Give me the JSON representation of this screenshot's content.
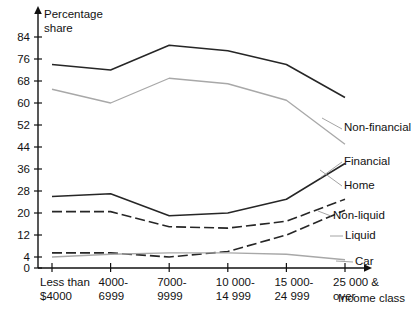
{
  "chart_data": {
    "type": "line",
    "title": "",
    "ylabel_line1": "Percentage",
    "ylabel_line2": "share",
    "xlabel": "Income class",
    "grid": false,
    "legend_position": "right-inline",
    "ylim": [
      0,
      88
    ],
    "yticks": [
      0,
      4,
      12,
      20,
      28,
      36,
      44,
      52,
      60,
      68,
      76,
      84
    ],
    "ytick_labels": [
      "0",
      "4",
      "12",
      "20",
      "28",
      "36",
      "44",
      "52",
      "60",
      "68",
      "76",
      "84"
    ],
    "categories": [
      "Less than\n$4000",
      "4000-\n6999",
      "7000-\n9999",
      "10 000-\n14 999",
      "15 000-\n24 999",
      "25 000 &\nover"
    ],
    "category_lines": [
      [
        "Less than",
        "$4000"
      ],
      [
        "4000-",
        "6999"
      ],
      [
        "7000-",
        "9999"
      ],
      [
        "10 000-",
        "14 999"
      ],
      [
        "15 000-",
        "24 999"
      ],
      [
        "25 000 &",
        "over"
      ]
    ],
    "series": [
      {
        "name": "Non-financial",
        "color": "#262626",
        "width": 1.5,
        "dash": "none",
        "values": [
          74,
          72,
          81,
          79,
          74,
          62
        ]
      },
      {
        "name": "Home",
        "color": "#a8a8a8",
        "width": 1.3,
        "dash": "none",
        "values": [
          65,
          60,
          69,
          67,
          61,
          45
        ]
      },
      {
        "name": "Financial",
        "color": "#262626",
        "width": 1.5,
        "dash": "none",
        "values": [
          26,
          27,
          19,
          20,
          25,
          38
        ]
      },
      {
        "name": "Non-liquid",
        "color": "#262626",
        "width": 1.6,
        "dash": "10,4",
        "values": [
          20.5,
          20.5,
          15,
          14.5,
          17,
          25
        ]
      },
      {
        "name": "Liquid",
        "color": "#262626",
        "width": 1.6,
        "dash": "10,4",
        "values": [
          5.5,
          5.5,
          4,
          6,
          12,
          21
        ]
      },
      {
        "name": "Car",
        "color": "#a8a8a8",
        "width": 1.3,
        "dash": "none",
        "values": [
          4,
          5,
          5.5,
          5.5,
          5,
          3
        ]
      }
    ],
    "annotations": [
      {
        "label": "Non-financial",
        "x": 344,
        "y": 131
      },
      {
        "label": "Financial",
        "x": 344,
        "y": 165
      },
      {
        "label": "Home",
        "x": 344,
        "y": 189
      },
      {
        "label": "Non-liquid",
        "x": 333,
        "y": 219
      },
      {
        "label": "Liquid",
        "x": 345,
        "y": 239
      },
      {
        "label": "Car",
        "x": 355,
        "y": 265
      }
    ]
  }
}
